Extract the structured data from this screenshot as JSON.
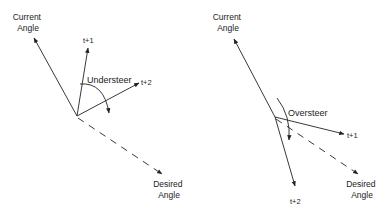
{
  "diagrams": [
    {
      "id": "understeer",
      "labels": {
        "current": [
          "Current",
          "Angle"
        ],
        "t1": "t+1",
        "t2": "t+2",
        "steer": "Understeer",
        "desired": [
          "Desired",
          "Angle"
        ]
      }
    },
    {
      "id": "oversteer",
      "labels": {
        "current": [
          "Current",
          "Angle"
        ],
        "t1": "t+1",
        "t2": "t+2",
        "steer": "Oversteer",
        "desired": [
          "Desired",
          "Angle"
        ]
      }
    }
  ],
  "colors": {
    "stroke": "#222222",
    "background": "#ffffff"
  }
}
